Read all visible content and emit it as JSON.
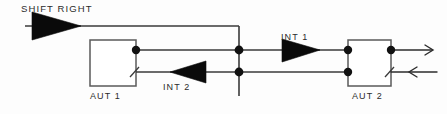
{
  "diagram": {
    "title": "SHIFT RIGHT",
    "background_color": "#fdfdfd",
    "line_color": "#3a3a3a",
    "fill_color": "#0a0a0a",
    "labels": {
      "shift_right": "SHIFT RIGHT",
      "aut_1": "AUT 1",
      "aut_2": "AUT 2",
      "int_1": "INT 1",
      "int_2": "INT 2"
    },
    "blocks": [
      {
        "name": "AUT 1",
        "label": "AUT 1"
      },
      {
        "name": "AUT 2",
        "label": "AUT 2"
      }
    ],
    "buffers": [
      {
        "name": "SHIFT RIGHT driver",
        "label": "SHIFT RIGHT",
        "direction": "right"
      },
      {
        "name": "INT 1",
        "label": "INT 1",
        "direction": "right"
      },
      {
        "name": "INT 2",
        "label": "INT 2",
        "direction": "left"
      }
    ]
  }
}
